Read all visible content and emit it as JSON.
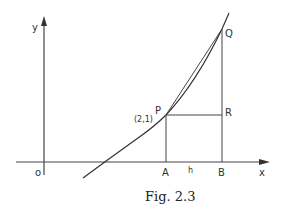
{
  "figure": {
    "caption": "Fig. 2.3",
    "axes": {
      "x_label": "x",
      "y_label": "y",
      "origin_label": "o"
    },
    "points": {
      "P": {
        "label": "P",
        "coords_label": "(2,1)"
      },
      "Q": {
        "label": "Q"
      },
      "R": {
        "label": "R"
      },
      "A": {
        "label": "A"
      },
      "B": {
        "label": "B"
      }
    },
    "segment_labels": {
      "AB": "h"
    },
    "colors": {
      "line": "#333333",
      "background": "#ffffff"
    }
  }
}
